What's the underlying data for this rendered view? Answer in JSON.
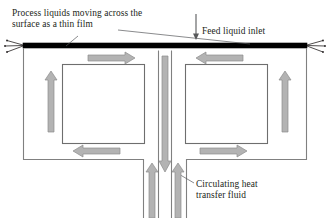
{
  "diagram": {
    "background_color": "#ffffff",
    "line_color": "#808080",
    "plate_color": "#000000",
    "arrow_fill": "#b3b3b3",
    "arrow_stroke": "#8c8c8c",
    "text_color": "#231f20"
  },
  "annotations": {
    "process_liquids": {
      "line1": "Process liquids moving across the",
      "line2": "surface as a thin film"
    },
    "feed_inlet": {
      "line1": "Feed liquid inlet"
    },
    "circulating_fluid": {
      "line1": "Circulating heat",
      "line2": "transfer fluid"
    }
  },
  "flow_arrows": [
    {
      "name": "left-chamber-top-flow",
      "direction": "right"
    },
    {
      "name": "left-chamber-side-flow",
      "direction": "up"
    },
    {
      "name": "left-chamber-bottom-flow",
      "direction": "left"
    },
    {
      "name": "right-chamber-top-flow",
      "direction": "left"
    },
    {
      "name": "right-chamber-side-flow",
      "direction": "up"
    },
    {
      "name": "right-chamber-bottom-flow",
      "direction": "right"
    },
    {
      "name": "center-inlet-downflow",
      "direction": "down"
    },
    {
      "name": "center-left-outflow",
      "direction": "up"
    },
    {
      "name": "center-right-outflow",
      "direction": "up"
    },
    {
      "name": "feed-inlet-arrow",
      "direction": "down"
    }
  ]
}
